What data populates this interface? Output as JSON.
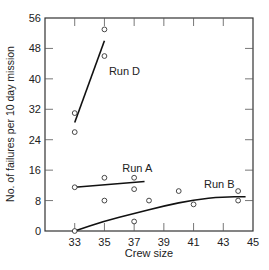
{
  "chart_data": {
    "type": "scatter",
    "title": "",
    "xlabel": "Crew size",
    "ylabel": "No. of failures per 10 day mission",
    "xlim": [
      31,
      45
    ],
    "ylim": [
      0,
      56
    ],
    "x_ticks": [
      33,
      35,
      37,
      39,
      41,
      43,
      45
    ],
    "y_ticks": [
      0,
      8,
      16,
      24,
      32,
      40,
      48,
      56
    ],
    "grid": false,
    "legend": "inline labels",
    "series": [
      {
        "name": "Run D",
        "points": [
          [
            33,
            26
          ],
          [
            33,
            31
          ],
          [
            35,
            46
          ],
          [
            35,
            53
          ]
        ],
        "fit_line": [
          [
            33,
            28.5
          ],
          [
            35,
            50
          ]
        ],
        "label_pos": [
          35.3,
          41
        ]
      },
      {
        "name": "Run A",
        "points": [
          [
            33,
            11.5
          ],
          [
            35,
            14
          ],
          [
            37,
            14
          ],
          [
            37,
            11
          ]
        ],
        "fit_line": [
          [
            33,
            11.5
          ],
          [
            37.7,
            13
          ]
        ],
        "label_pos": [
          36.2,
          15.5
        ]
      },
      {
        "name": "Run B",
        "points": [
          [
            33,
            0
          ],
          [
            35,
            8
          ],
          [
            37,
            2.5
          ],
          [
            38,
            8
          ],
          [
            40,
            10.5
          ],
          [
            41,
            7
          ],
          [
            44,
            10.5
          ],
          [
            44,
            8
          ]
        ],
        "fit_curve": [
          [
            33,
            0
          ],
          [
            35,
            2.6
          ],
          [
            37,
            4.6
          ],
          [
            39,
            6.6
          ],
          [
            41,
            8.2
          ],
          [
            43,
            9
          ],
          [
            44.5,
            9
          ]
        ],
        "label_pos": [
          41.7,
          11.2
        ]
      }
    ]
  }
}
